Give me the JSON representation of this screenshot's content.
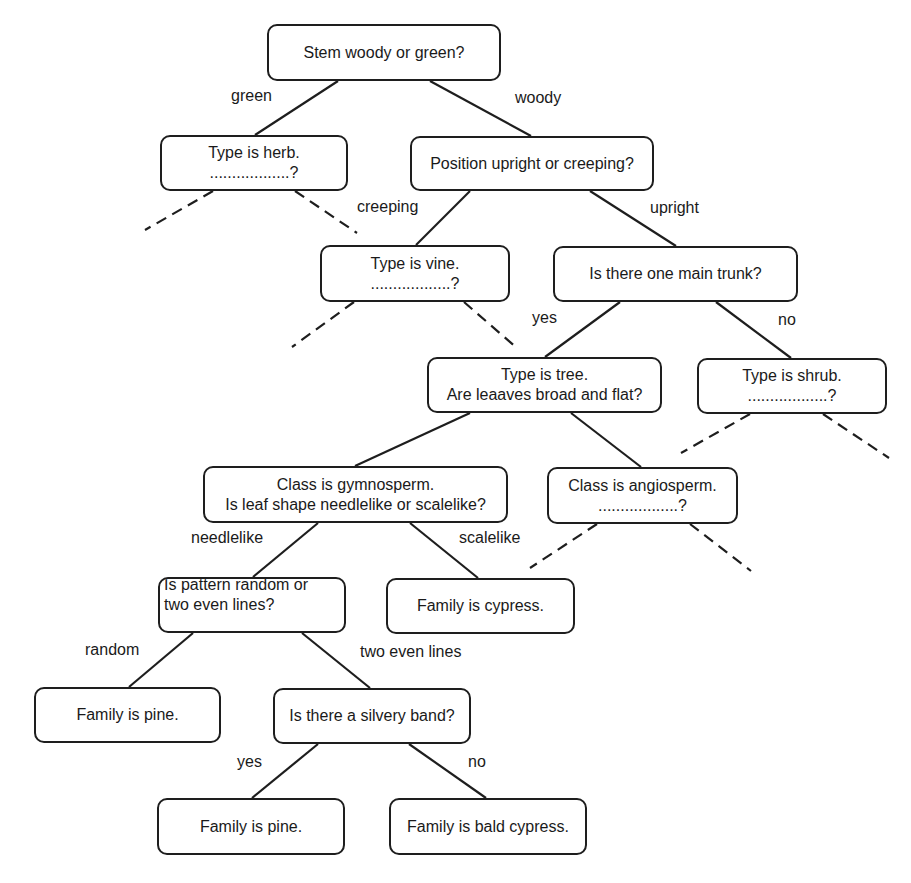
{
  "diagram": {
    "colors": {
      "stroke": "#1e1e1e",
      "background": "#ffffff",
      "text": "#1a1a1a"
    },
    "nodes": [
      {
        "id": "root",
        "lines": [
          "Stem woody or green?"
        ],
        "x": 267,
        "y": 24,
        "w": 234,
        "h": 57
      },
      {
        "id": "herb",
        "lines": [
          "Type is herb.",
          "..................?"
        ],
        "x": 160,
        "y": 135,
        "w": 188,
        "h": 56
      },
      {
        "id": "position",
        "lines": [
          "Position upright or creeping?"
        ],
        "x": 410,
        "y": 136,
        "w": 244,
        "h": 55
      },
      {
        "id": "vine",
        "lines": [
          "Type is vine.",
          "..................?"
        ],
        "x": 320,
        "y": 245,
        "w": 190,
        "h": 57
      },
      {
        "id": "trunk",
        "lines": [
          "Is there one main trunk?"
        ],
        "x": 553,
        "y": 246,
        "w": 245,
        "h": 56
      },
      {
        "id": "tree",
        "lines": [
          "Type is tree.",
          "Are leaaves broad and flat?"
        ],
        "x": 427,
        "y": 357,
        "w": 235,
        "h": 56
      },
      {
        "id": "shrub",
        "lines": [
          "Type is shrub.",
          "..................?"
        ],
        "x": 697,
        "y": 358,
        "w": 190,
        "h": 56
      },
      {
        "id": "gymnosperm",
        "lines": [
          "Class is gymnosperm.",
          "Is leaf shape needlelike or scalelike?"
        ],
        "x": 203,
        "y": 466,
        "w": 305,
        "h": 57
      },
      {
        "id": "angiosperm",
        "lines": [
          "Class is angiosperm.",
          "..................?"
        ],
        "x": 547,
        "y": 467,
        "w": 191,
        "h": 57
      },
      {
        "id": "pattern",
        "lines": [
          "Is pattern random or",
          "two even lines?"
        ],
        "x": 158,
        "y": 577,
        "w": 188,
        "h": 56,
        "align": "left"
      },
      {
        "id": "cypress",
        "lines": [
          "Family is cypress."
        ],
        "x": 386,
        "y": 578,
        "w": 189,
        "h": 56
      },
      {
        "id": "pine1",
        "lines": [
          "Family is pine."
        ],
        "x": 34,
        "y": 687,
        "w": 187,
        "h": 56
      },
      {
        "id": "silvery",
        "lines": [
          "Is there a silvery band?"
        ],
        "x": 273,
        "y": 688,
        "w": 198,
        "h": 56
      },
      {
        "id": "pine2",
        "lines": [
          "Family is pine."
        ],
        "x": 157,
        "y": 798,
        "w": 188,
        "h": 57
      },
      {
        "id": "baldcypress",
        "lines": [
          "Family is bald cypress."
        ],
        "x": 389,
        "y": 798,
        "w": 198,
        "h": 57
      }
    ],
    "edges": [
      {
        "from": "root",
        "to": "herb",
        "x1": 338,
        "y1": 81,
        "x2": 255,
        "y2": 135,
        "style": "solid"
      },
      {
        "from": "root",
        "to": "position",
        "x1": 430,
        "y1": 81,
        "x2": 531,
        "y2": 136,
        "style": "solid"
      },
      {
        "from": "herb",
        "to": null,
        "x1": 213,
        "y1": 191,
        "x2": 145,
        "y2": 230,
        "style": "dashed"
      },
      {
        "from": "herb",
        "to": null,
        "x1": 295,
        "y1": 191,
        "x2": 357,
        "y2": 233,
        "style": "dashed"
      },
      {
        "from": "position",
        "to": "vine",
        "x1": 470,
        "y1": 191,
        "x2": 416,
        "y2": 245,
        "style": "solid"
      },
      {
        "from": "position",
        "to": "trunk",
        "x1": 590,
        "y1": 191,
        "x2": 676,
        "y2": 246,
        "style": "solid"
      },
      {
        "from": "vine",
        "to": null,
        "x1": 354,
        "y1": 302,
        "x2": 292,
        "y2": 347,
        "style": "dashed"
      },
      {
        "from": "vine",
        "to": null,
        "x1": 464,
        "y1": 302,
        "x2": 518,
        "y2": 349,
        "style": "dashed"
      },
      {
        "from": "trunk",
        "to": "tree",
        "x1": 620,
        "y1": 302,
        "x2": 545,
        "y2": 357,
        "style": "solid"
      },
      {
        "from": "trunk",
        "to": "shrub",
        "x1": 716,
        "y1": 302,
        "x2": 791,
        "y2": 358,
        "style": "solid"
      },
      {
        "from": "shrub",
        "to": null,
        "x1": 750,
        "y1": 414,
        "x2": 681,
        "y2": 453,
        "style": "dashed"
      },
      {
        "from": "shrub",
        "to": null,
        "x1": 823,
        "y1": 414,
        "x2": 889,
        "y2": 458,
        "style": "dashed"
      },
      {
        "from": "tree",
        "to": "gymnosperm",
        "x1": 470,
        "y1": 413,
        "x2": 355,
        "y2": 466,
        "style": "solid"
      },
      {
        "from": "tree",
        "to": "angiosperm",
        "x1": 571,
        "y1": 413,
        "x2": 641,
        "y2": 467,
        "style": "solid"
      },
      {
        "from": "angiosperm",
        "to": null,
        "x1": 597,
        "y1": 524,
        "x2": 530,
        "y2": 568,
        "style": "dashed"
      },
      {
        "from": "angiosperm",
        "to": null,
        "x1": 690,
        "y1": 524,
        "x2": 751,
        "y2": 571,
        "style": "dashed"
      },
      {
        "from": "gymnosperm",
        "to": "pattern",
        "x1": 318,
        "y1": 523,
        "x2": 253,
        "y2": 577,
        "style": "solid"
      },
      {
        "from": "gymnosperm",
        "to": "cypress",
        "x1": 410,
        "y1": 523,
        "x2": 478,
        "y2": 578,
        "style": "solid"
      },
      {
        "from": "pattern",
        "to": "pine1",
        "x1": 193,
        "y1": 633,
        "x2": 129,
        "y2": 687,
        "style": "solid"
      },
      {
        "from": "pattern",
        "to": "silvery",
        "x1": 302,
        "y1": 633,
        "x2": 370,
        "y2": 688,
        "style": "solid"
      },
      {
        "from": "silvery",
        "to": "pine2",
        "x1": 318,
        "y1": 744,
        "x2": 252,
        "y2": 798,
        "style": "solid"
      },
      {
        "from": "silvery",
        "to": "baldcypress",
        "x1": 409,
        "y1": 744,
        "x2": 486,
        "y2": 798,
        "style": "solid"
      }
    ],
    "edge_labels": [
      {
        "id": "green",
        "text": "green",
        "x": 231,
        "y": 96
      },
      {
        "id": "woody",
        "text": "woody",
        "x": 515,
        "y": 98
      },
      {
        "id": "creeping",
        "text": "creeping",
        "x": 357,
        "y": 207
      },
      {
        "id": "upright",
        "text": "upright",
        "x": 650,
        "y": 208
      },
      {
        "id": "yes-trunk",
        "text": "yes",
        "x": 532,
        "y": 318
      },
      {
        "id": "no-trunk",
        "text": "no",
        "x": 778,
        "y": 320
      },
      {
        "id": "needlelike",
        "text": "needlelike",
        "x": 191,
        "y": 538
      },
      {
        "id": "scalelike",
        "text": "scalelike",
        "x": 459,
        "y": 538
      },
      {
        "id": "random",
        "text": "random",
        "x": 85,
        "y": 650
      },
      {
        "id": "two-even-lines",
        "text": "two even lines",
        "x": 360,
        "y": 652
      },
      {
        "id": "yes-silvery",
        "text": "yes",
        "x": 237,
        "y": 762
      },
      {
        "id": "no-silvery",
        "text": "no",
        "x": 468,
        "y": 762
      }
    ]
  }
}
